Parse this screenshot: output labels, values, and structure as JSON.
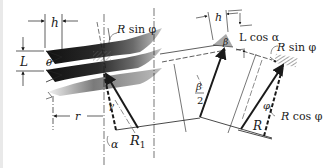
{
  "figure": {
    "labels": {
      "h_left": "h",
      "L": "L",
      "theta": "θ",
      "R_sin_phi_left_R": "R",
      "R_sin_phi_left_rest": " sin φ",
      "gamma": "γ",
      "r": "r",
      "alpha": "α",
      "R1_main": "R",
      "R1_sub": "1",
      "h_right": "h",
      "beta": "β",
      "L_cos_alpha": "L cos α",
      "beta_over_2_num": "β",
      "beta_over_2_den": "2",
      "R_sin_phi_right_R": "R",
      "R_sin_phi_right_rest": " sin φ",
      "phi": "φ",
      "R": "R",
      "R_cos_phi_R": "R",
      "R_cos_phi_rest": " cos φ"
    },
    "colors": {
      "ink": "#1a1a1a",
      "thread_dark": "#1e1e1e",
      "thread_light": "#bdbdbd",
      "hatch": "#8a8a8a"
    }
  }
}
